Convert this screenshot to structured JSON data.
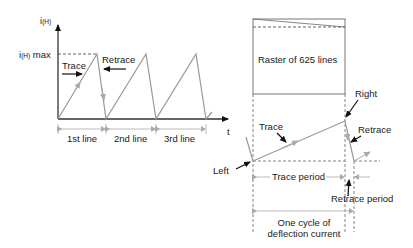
{
  "left_graph": {
    "y_axis_label": "i",
    "y_axis_subscript": "(H)",
    "y_max_label_main": "i",
    "y_max_label_sub": "(H)",
    "y_max_label_suffix": " max",
    "x_axis_label": "t",
    "trace_label": "Trace",
    "retrace_label": "Retrace",
    "line_labels": [
      "1st line",
      "2nd line",
      "3rd line"
    ]
  },
  "right_graph": {
    "raster_label": "Raster of 625 lines",
    "right_label": "Right",
    "left_label": "Left",
    "trace_label": "Trace",
    "retrace_label": "Retrace",
    "trace_period_label": "Trace period",
    "retrace_period_label": "Retrace period",
    "cycle_label_line1": "One cycle of",
    "cycle_label_line2": "deflection current"
  },
  "colors": {
    "axis": "#333333",
    "waveform": "#999999",
    "arrow_gray": "#aaaaaa",
    "text": "#1a1a1a"
  }
}
